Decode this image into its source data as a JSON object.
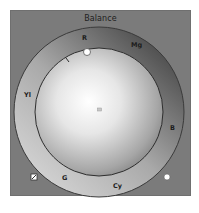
{
  "panel": {
    "title": "Balance"
  },
  "wheel": {
    "labels": [
      {
        "id": "red",
        "text": "R"
      },
      {
        "id": "magenta",
        "text": "Mg"
      },
      {
        "id": "blue",
        "text": "B"
      },
      {
        "id": "cyan",
        "text": "Cy"
      },
      {
        "id": "green",
        "text": "G"
      },
      {
        "id": "yellow",
        "text": "Yl"
      }
    ],
    "handle_icon": "circle-handle",
    "center_icon": "center-marker",
    "tick_icon": "tick-mark"
  },
  "controls": {
    "reset_icon": "reset-icon",
    "dot_icon": "circle-dot"
  },
  "colors": {
    "panel_bg": "#7b7b7b",
    "ring_light": "#c4c4c4",
    "ring_dark": "#4a4a4a",
    "sphere_highlight": "#ffffff",
    "sphere_shadow": "#6a6a6a"
  }
}
